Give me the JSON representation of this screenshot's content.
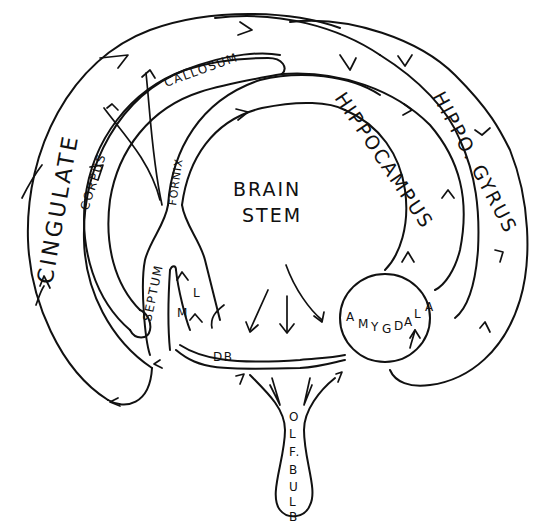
{
  "diagram": {
    "title": "",
    "labels": {
      "cingulate": "CINGULATE",
      "corpus": "CORPUS",
      "callosum": "CALLOSUM",
      "fornix": "FORNIX",
      "hippocampus": "HIPPOCAMPUS",
      "hippo_gyrus": "HIPPO. GYRUS",
      "brain": "BRAIN",
      "stem": "STEM",
      "septum": "SEPTUM",
      "lateral": "L",
      "medial": "M",
      "db": "DB",
      "amygdala_chars": [
        "A",
        "M",
        "Y",
        "G",
        "D",
        "A",
        "L",
        "A"
      ],
      "olf_bulb_chars": [
        "O",
        "L",
        "F.",
        "B",
        "U",
        "L",
        "B"
      ]
    },
    "nodes": [
      {
        "id": "cingulate",
        "label": "CINGULATE",
        "shape": "outer-arc-band"
      },
      {
        "id": "corpus-callosum",
        "label": "CORPUS CALLOSUM",
        "shape": "arc-band"
      },
      {
        "id": "fornix",
        "label": "FORNIX",
        "shape": "arc-band"
      },
      {
        "id": "hippocampus",
        "label": "HIPPOCAMPUS",
        "shape": "arc-band"
      },
      {
        "id": "hippo-gyrus",
        "label": "HIPPO. GYRUS",
        "shape": "outer-arc-band"
      },
      {
        "id": "brain-stem",
        "label": "BRAIN STEM",
        "shape": "center-region"
      },
      {
        "id": "septum",
        "label": "SEPTUM",
        "shape": "y-fork"
      },
      {
        "id": "amygdala",
        "label": "AMYGDALA",
        "shape": "circle"
      },
      {
        "id": "olf-bulb",
        "label": "OLF. BULB",
        "shape": "stalk"
      },
      {
        "id": "db",
        "label": "DB",
        "shape": "band"
      }
    ],
    "edges": [
      {
        "from": "cingulate",
        "to": "hippo-gyrus",
        "direction": "clockwise"
      },
      {
        "from": "hippo-gyrus",
        "to": "amygdala"
      },
      {
        "from": "hippocampus",
        "to": "fornix"
      },
      {
        "from": "fornix",
        "to": "septum"
      },
      {
        "from": "brain-stem",
        "to": "db"
      },
      {
        "from": "brain-stem",
        "to": "amygdala"
      },
      {
        "from": "olf-bulb",
        "to": "db"
      },
      {
        "from": "olf-bulb",
        "to": "amygdala"
      },
      {
        "from": "septum",
        "to": "cingulate"
      },
      {
        "from": "amygdala",
        "to": "hippocampus"
      }
    ]
  }
}
